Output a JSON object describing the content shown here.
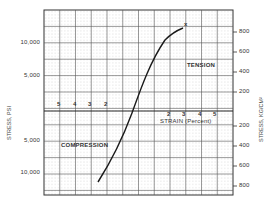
{
  "chart_data": {
    "type": "line",
    "title": "",
    "xlabel": "STRAIN (Percent)",
    "ylabel_left": "STRESS, PSI",
    "ylabel_right": "STRESS, KG/CM²",
    "x_ticks_compression": [
      "5",
      "4",
      "3",
      "2"
    ],
    "x_ticks_tension": [
      "2",
      "3",
      "4",
      "5"
    ],
    "y_ticks_left_tension": [
      "10,000",
      "5,000"
    ],
    "y_ticks_left_compression": [
      "5,000",
      "10,000"
    ],
    "y_ticks_right_tension": [
      "800",
      "600",
      "400",
      "200"
    ],
    "y_ticks_right_compression": [
      "200",
      "400",
      "600",
      "800"
    ],
    "annotations": [
      "TENSION",
      "COMPRESSION",
      "x"
    ],
    "grid": true,
    "series": [
      {
        "name": "stress-strain",
        "x_strain_percent": [
          -1.8,
          -1.2,
          -0.6,
          0.0,
          0.6,
          1.2,
          1.8,
          2.4,
          2.8
        ],
        "y_stress_psi": [
          -9500,
          -7200,
          -4300,
          0,
          3300,
          5400,
          6600,
          7300,
          7600
        ]
      }
    ],
    "xlim": [
      -6,
      6
    ],
    "ylim_psi": [
      -13000,
      13000
    ],
    "ylim_kgcm2": [
      -900,
      900
    ],
    "end_marker": "x"
  },
  "labels": {
    "left_axis_title": "STRESS, PSI",
    "right_axis_title": "STRESS, KG/CM²",
    "strain_title": "STRAIN (Percent)",
    "tension": "TENSION",
    "compression": "COMPRESSION",
    "end_mark": "x",
    "left_ticks": [
      {
        "text": "10,000",
        "y": 43
      },
      {
        "text": "5,000",
        "y": 76
      },
      {
        "text": "5,000",
        "y": 141
      },
      {
        "text": "10,000",
        "y": 173
      }
    ],
    "right_ticks": [
      {
        "text": "800",
        "y": 32
      },
      {
        "text": "600",
        "y": 52
      },
      {
        "text": "400",
        "y": 72
      },
      {
        "text": "200",
        "y": 92
      },
      {
        "text": "200",
        "y": 126
      },
      {
        "text": "400",
        "y": 146
      },
      {
        "text": "600",
        "y": 166
      },
      {
        "text": "800",
        "y": 186
      }
    ],
    "strain_ticks_left": [
      {
        "text": "5",
        "x": 59
      },
      {
        "text": "4",
        "x": 75
      },
      {
        "text": "3",
        "x": 90
      },
      {
        "text": "2",
        "x": 106
      }
    ],
    "strain_ticks_right": [
      {
        "text": "2",
        "x": 169
      },
      {
        "text": "3",
        "x": 184
      },
      {
        "text": "4",
        "x": 200
      },
      {
        "text": "5",
        "x": 215
      }
    ]
  }
}
